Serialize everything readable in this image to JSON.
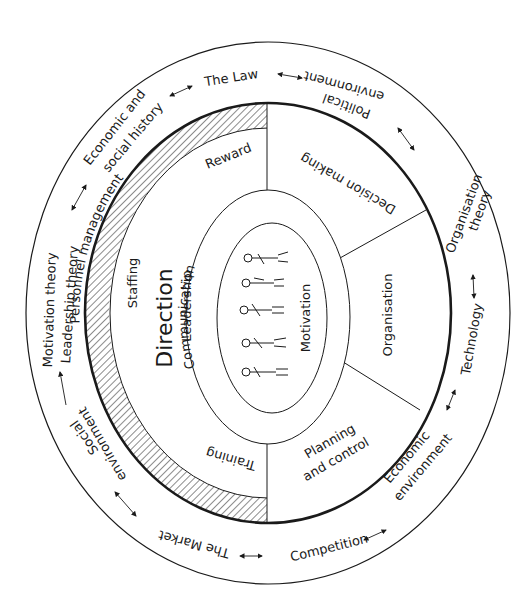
{
  "diagram": {
    "type": "concentric-ellipse management model",
    "center_figure": {
      "description": "five stylised human figures standing in a row",
      "inner_labels": [
        "Communication",
        "Motivation"
      ]
    },
    "core": {
      "title": "Direction",
      "subtitle": "Leadership",
      "left_items": [
        "Staffing",
        "Reward",
        "Training"
      ],
      "ring_left_label": "Personnel management"
    },
    "segments": [
      {
        "label": "Decision making"
      },
      {
        "label": "Organisation"
      },
      {
        "label_line1": "Planning",
        "label_line2": "and control"
      }
    ],
    "outer_ring": [
      {
        "label": "The Law"
      },
      {
        "label_line1": "Political",
        "label_line2": "environment"
      },
      {
        "label_line1": "Organisation",
        "label_line2": "theory"
      },
      {
        "label": "Technology"
      },
      {
        "label_line1": "Economic",
        "label_line2": "environment"
      },
      {
        "label": "Competition"
      },
      {
        "label": "The Market"
      },
      {
        "label_line1": "Social",
        "label_line2": "environment"
      },
      {
        "label_line1": "Motivation theory",
        "label_line2": "Leadership theory"
      },
      {
        "label_line1": "Economic and",
        "label_line2": "social history"
      }
    ],
    "colors": {
      "line": "#1a1a1a",
      "background": "#ffffff"
    }
  }
}
